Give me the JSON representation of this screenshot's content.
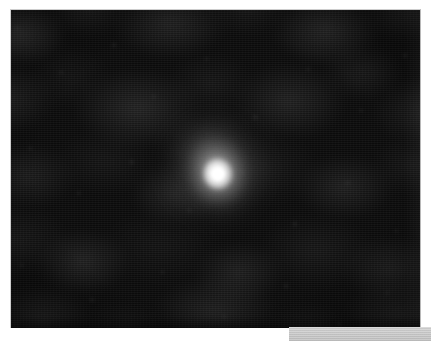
{
  "document": {
    "kind": "astronomical-image-frame",
    "page_background_color": "#ffffff"
  },
  "frame": {
    "label": "point-source-exposure",
    "x": 10,
    "y": 9,
    "width": 411,
    "height": 319,
    "background_color": "#0a0a0a",
    "border_color": "#cdcdcd",
    "noise_description": "mottled dark background with horizontal striping artifacts",
    "noise_dark_color": "#101010",
    "noise_light_color": "#3a3a3a"
  },
  "source": {
    "label": "bright-point-source",
    "center_x": 217,
    "center_y": 173,
    "core_color": "#ffffff",
    "core_diameter_px": 13,
    "halo_diameter_px": 62,
    "outer_halo_diameter_px": 110,
    "halo_orientation": "extended toward upper-left"
  },
  "bottom_band": {
    "label": "gray-footer-band",
    "x": 289,
    "y": 327,
    "width": 142,
    "height": 14,
    "color": "#c9c9c9",
    "text": ""
  }
}
